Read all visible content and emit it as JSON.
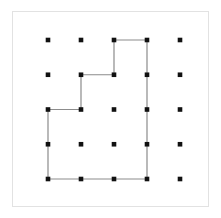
{
  "figure": {
    "kind": "geoboard-dot-grid-polygon",
    "background_color": "#ffffff",
    "frame": {
      "border_color": "#e2e2e2",
      "x": 12,
      "y": 11,
      "width": 197,
      "height": 196
    },
    "grid": {
      "rows": 5,
      "columns": 5,
      "origin_x": 48,
      "origin_y": 40,
      "spacing_x": 33,
      "spacing_y": 34.75,
      "dot_color": "#111111",
      "dot_size": 4.6,
      "dot_shape": "square",
      "total_dots": 25
    },
    "polygon": {
      "stroke_color": "#8c8c8c",
      "stroke_width": 1.2,
      "fill": "none",
      "closed": true,
      "vertex_count": 8,
      "vertices_grid": [
        {
          "col": 2,
          "row": 0
        },
        {
          "col": 3,
          "row": 0
        },
        {
          "col": 3,
          "row": 4
        },
        {
          "col": 0,
          "row": 4
        },
        {
          "col": 0,
          "row": 2
        },
        {
          "col": 1,
          "row": 2
        },
        {
          "col": 1,
          "row": 1
        },
        {
          "col": 2,
          "row": 1
        }
      ]
    }
  }
}
